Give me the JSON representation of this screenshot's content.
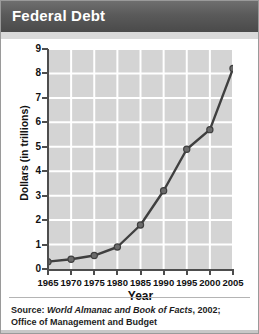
{
  "header": {
    "title": "Federal Debt"
  },
  "chart_data": {
    "type": "line",
    "title": "Federal Debt",
    "xlabel": "Year",
    "ylabel": "Dollars (in trillions)",
    "categories": [
      "1965",
      "1970",
      "1975",
      "1980",
      "1985",
      "1990",
      "1995",
      "2000",
      "2005"
    ],
    "x": [
      1965,
      1970,
      1975,
      1980,
      1985,
      1990,
      1995,
      2000,
      2005
    ],
    "values": [
      0.3,
      0.4,
      0.55,
      0.9,
      1.8,
      3.2,
      4.9,
      5.7,
      8.2
    ],
    "xlim": [
      1965,
      2005
    ],
    "ylim": [
      0,
      9
    ],
    "ytick_labels": [
      "0",
      "1",
      "2",
      "3",
      "4",
      "5",
      "6",
      "7",
      "8",
      "9"
    ],
    "ytick_values": [
      0,
      1,
      2,
      3,
      4,
      5,
      6,
      7,
      8,
      9
    ],
    "grid": true,
    "legend": "none",
    "line_color": "#3f3f3f",
    "marker_color": "#6b6b6b",
    "plot_background": "#d4d4d4",
    "gridline_color": "#ffffff"
  },
  "source": {
    "line1_prefix": "Source: ",
    "line1_italic": "World Almanac and Book of Facts",
    "line1_suffix": ", 2002;",
    "line2": "Office of Management and Budget"
  }
}
